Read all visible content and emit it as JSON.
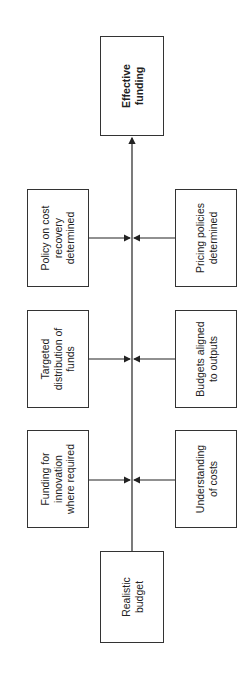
{
  "diagram": {
    "goal": {
      "label": "Effective\nfunding"
    },
    "source": {
      "label": "Realistic\nbudget"
    },
    "left_factors": [
      {
        "label": "Policy on cost\nrecovery\ndetermined"
      },
      {
        "label": "Targeted\ndistribution of\nfunds"
      },
      {
        "label": "Funding for\ninnovation\nwhere required"
      }
    ],
    "right_factors": [
      {
        "label": "Pricing policies\ndetermined"
      },
      {
        "label": "Budgets aligned\nto outputs"
      },
      {
        "label": "Understanding\nof costs"
      }
    ]
  }
}
